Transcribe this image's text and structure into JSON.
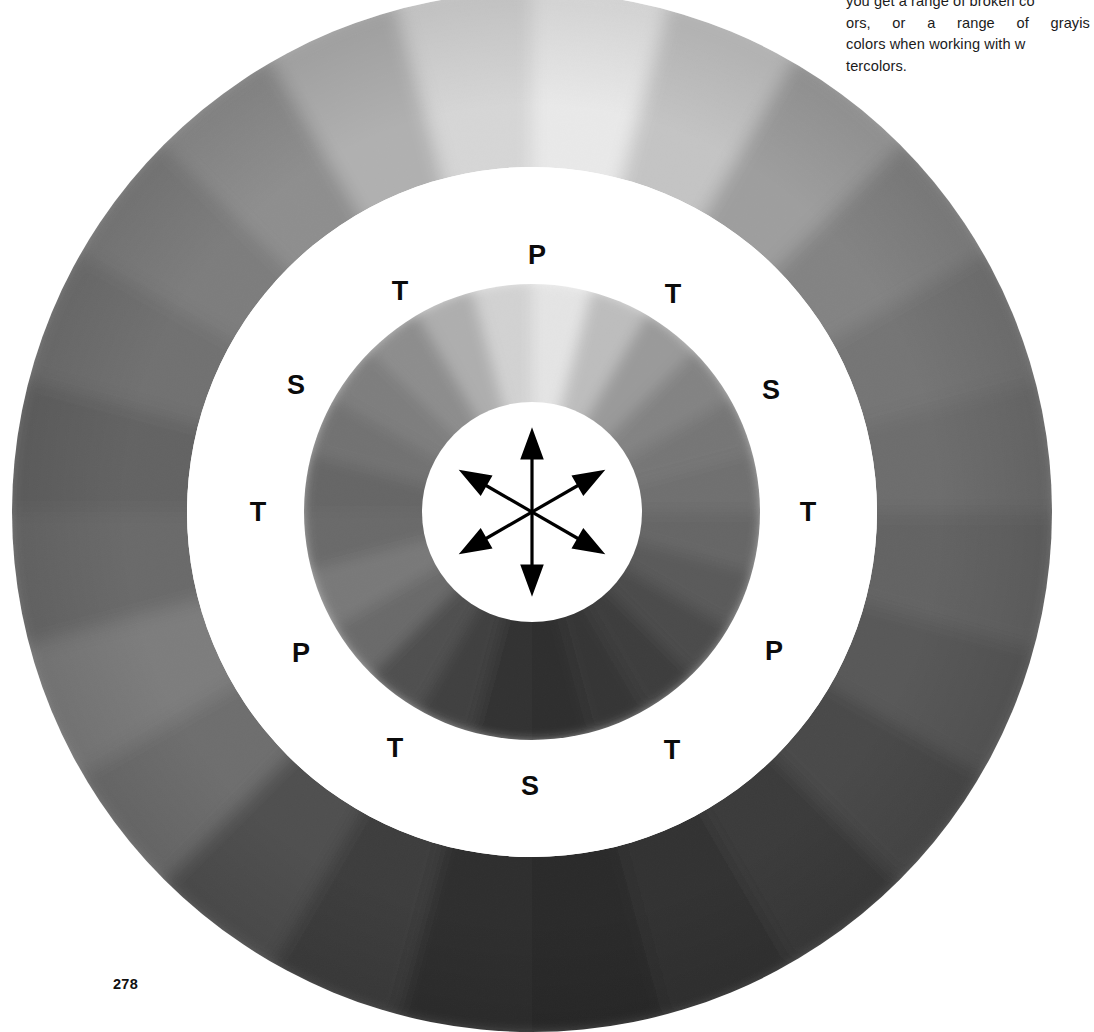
{
  "page": {
    "folio": "278",
    "background_color": "#ffffff"
  },
  "body_copy": {
    "note": "text column clipped by the right page edge",
    "lines": [
      "you get a range of broken co",
      "ors,  or  a  range  of  grayis",
      "colors when working with w",
      "tercolors."
    ]
  },
  "figure": {
    "name": "grayscale-color-wheel",
    "center": {
      "x": 532,
      "y": 512
    },
    "rings": [
      {
        "id": "outer-ring",
        "inner_radius": 345,
        "outer_radius": 520,
        "kind": "gradient"
      },
      {
        "id": "white-band",
        "inner_radius": 228,
        "outer_radius": 345,
        "kind": "solid",
        "color": "#ffffff"
      },
      {
        "id": "inner-ring",
        "inner_radius": 110,
        "outer_radius": 228,
        "kind": "gradient"
      },
      {
        "id": "hub",
        "inner_radius": 0,
        "outer_radius": 72,
        "kind": "solid",
        "color": "#ffffff"
      }
    ],
    "gradient_stops": [
      {
        "angle_deg": 0,
        "position": "top",
        "color": "#ececec"
      },
      {
        "angle_deg": 30,
        "position": "top-right",
        "color": "#b9b9b9"
      },
      {
        "angle_deg": 60,
        "position": "upper-right",
        "color": "#7e7e7e"
      },
      {
        "angle_deg": 90,
        "position": "right",
        "color": "#6b6b6b"
      },
      {
        "angle_deg": 120,
        "position": "lower-right",
        "color": "#565656"
      },
      {
        "angle_deg": 150,
        "position": "bottom-right",
        "color": "#3a3a3a"
      },
      {
        "angle_deg": 180,
        "position": "bottom",
        "color": "#2b2b2b"
      },
      {
        "angle_deg": 210,
        "position": "bottom-left",
        "color": "#464646"
      },
      {
        "angle_deg": 240,
        "position": "lower-left",
        "color": "#7a7a7a"
      },
      {
        "angle_deg": 270,
        "position": "left",
        "color": "#676767"
      },
      {
        "angle_deg": 300,
        "position": "upper-left",
        "color": "#7b7b7b"
      },
      {
        "angle_deg": 330,
        "position": "top-left",
        "color": "#9d9d9d"
      }
    ],
    "labels": [
      {
        "text": "P",
        "meaning": "primary",
        "angle_deg": 0,
        "x": 537,
        "y": 255
      },
      {
        "text": "T",
        "meaning": "tertiary",
        "angle_deg": 30,
        "x": 673,
        "y": 294
      },
      {
        "text": "S",
        "meaning": "secondary",
        "angle_deg": 60,
        "x": 771,
        "y": 390
      },
      {
        "text": "T",
        "meaning": "tertiary",
        "angle_deg": 90,
        "x": 808,
        "y": 512
      },
      {
        "text": "P",
        "meaning": "primary",
        "angle_deg": 120,
        "x": 774,
        "y": 651
      },
      {
        "text": "T",
        "meaning": "tertiary",
        "angle_deg": 150,
        "x": 672,
        "y": 750
      },
      {
        "text": "S",
        "meaning": "secondary",
        "angle_deg": 180,
        "x": 530,
        "y": 786
      },
      {
        "text": "T",
        "meaning": "tertiary",
        "angle_deg": 210,
        "x": 395,
        "y": 748
      },
      {
        "text": "P",
        "meaning": "primary",
        "angle_deg": 240,
        "x": 301,
        "y": 653
      },
      {
        "text": "T",
        "meaning": "tertiary",
        "angle_deg": 270,
        "x": 258,
        "y": 512
      },
      {
        "text": "S",
        "meaning": "secondary",
        "angle_deg": 300,
        "x": 296,
        "y": 385
      },
      {
        "text": "T",
        "meaning": "tertiary",
        "angle_deg": 330,
        "x": 400,
        "y": 291
      }
    ],
    "hub_arrows": {
      "count": 6,
      "style": "double-headed radiating arrows indicating complementary pairs",
      "pair_angles_deg": [
        0,
        60,
        120
      ],
      "color": "#000000"
    }
  }
}
